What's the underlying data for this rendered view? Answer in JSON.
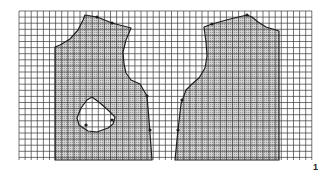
{
  "figure": {
    "number_label": "1",
    "grid": {
      "x0": 19,
      "y0": 11,
      "x1": 312,
      "y1": 160,
      "cell": 6.1,
      "line_color": "#3a3a3a",
      "background": "#ffffff"
    },
    "fill_color": "#c8c8c8",
    "outline_color": "#1e1e1e",
    "pieces": [
      {
        "name": "left-bodice-piece",
        "points": "55,47 60,45 70,39 78,30 83,20 85,15 97,17 112,23 131,28 126,40 123,52 124,64 126,73 131,80 140,84 147,96 149,120 152,160 55,160",
        "markers": [
          [
            97,
            17
          ],
          [
            112,
            23
          ],
          [
            147,
            96
          ],
          [
            150,
            130
          ]
        ]
      },
      {
        "name": "right-bodice-piece",
        "points": "204,27 212,24 230,19 247,15 252,17 258,22 266,27 279,31 279,160 175,160 178,130 181,104 186,90 192,84 199,78 205,68 207,56 206,42",
        "markers": [
          [
            212,
            24
          ],
          [
            247,
            15
          ],
          [
            182,
            100
          ],
          [
            178,
            130
          ]
        ]
      }
    ],
    "pocket": {
      "name": "pocket-outline",
      "points": "92,97 100,103 108,110 115,117 113,124 108,128 97,132 88,131 79,125 77,118 81,108 87,100",
      "markers": [
        [
          112,
          120
        ],
        [
          86,
          125
        ]
      ]
    }
  }
}
